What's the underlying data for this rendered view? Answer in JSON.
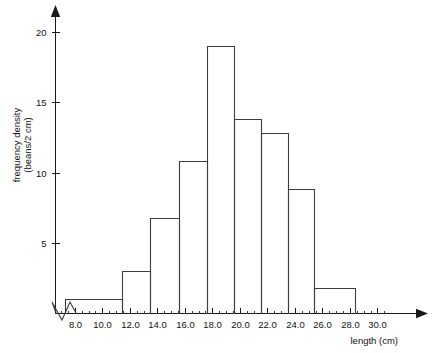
{
  "chart_data": {
    "type": "bar",
    "title": "",
    "subtitle": "",
    "xlabel": "length (cm)",
    "ylabel": "frequency density\n(beans/2 cm)",
    "ylabel_line1": "frequency density",
    "ylabel_line2": "(beans/2 cm)",
    "xlim": [
      6.6,
      30.8
    ],
    "ylim": [
      0,
      21
    ],
    "grid": false,
    "legend": false,
    "axis_break_x": true,
    "x_tick_labels": [
      "8.0",
      "10.0",
      "12.0",
      "14.0",
      "16.0",
      "18.0",
      "20.0",
      "22.0",
      "24.0",
      "26.0",
      "28.0",
      "30.0"
    ],
    "x_tick_values": [
      8.0,
      10.0,
      12.0,
      14.0,
      16.0,
      18.0,
      20.0,
      22.0,
      24.0,
      26.0,
      28.0,
      30.0
    ],
    "x_minor_step": 0.5,
    "y_tick_labels": [
      "5",
      "10",
      "15",
      "20"
    ],
    "y_tick_values": [
      5,
      10,
      15,
      20
    ],
    "bin_edges": [
      7.3,
      11.4,
      13.5,
      15.6,
      17.6,
      19.6,
      21.5,
      23.5,
      25.4,
      28.4
    ],
    "bins": [
      {
        "x0": 7.3,
        "x1": 11.4,
        "value": 1.0
      },
      {
        "x0": 11.4,
        "x1": 13.5,
        "value": 3.0
      },
      {
        "x0": 13.5,
        "x1": 15.6,
        "value": 6.8
      },
      {
        "x0": 15.6,
        "x1": 17.6,
        "value": 10.8
      },
      {
        "x0": 17.6,
        "x1": 19.6,
        "value": 19.0
      },
      {
        "x0": 19.6,
        "x1": 21.5,
        "value": 13.8
      },
      {
        "x0": 21.5,
        "x1": 23.5,
        "value": 12.8
      },
      {
        "x0": 23.5,
        "x1": 25.4,
        "value": 8.8
      },
      {
        "x0": 25.4,
        "x1": 28.4,
        "value": 1.8
      }
    ],
    "categories": [
      "7.3-11.4",
      "11.4-13.5",
      "13.5-15.6",
      "15.6-17.6",
      "17.6-19.6",
      "19.6-21.5",
      "21.5-23.5",
      "23.5-25.4",
      "25.4-28.4"
    ],
    "values": [
      1.0,
      3.0,
      6.8,
      10.8,
      19.0,
      13.8,
      12.8,
      8.8,
      1.8
    ],
    "colors": {
      "axis": "#1a1a1a",
      "bar_stroke": "#3d3d3d",
      "bar_fill": "none",
      "background": "#ffffff",
      "text": "#111111"
    }
  }
}
